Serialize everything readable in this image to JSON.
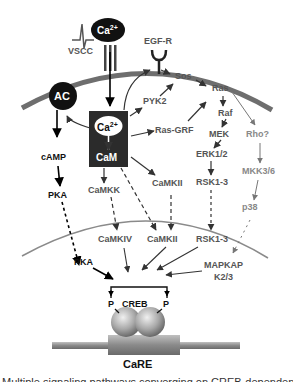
{
  "diagram": {
    "type": "signaling-pathway",
    "membrane_nodes": {
      "vscc": "VSCC",
      "ca_ext": "Ca",
      "ca_ext_sup": "2+",
      "egfr": "EGF-R",
      "ac": "AC"
    },
    "cytoplasm_nodes": {
      "ca_int": "Ca",
      "ca_int_sup": "2+",
      "cam": "CaM",
      "camp": "cAMP",
      "pka_cyto": "PKA",
      "pyk2": "PYK2",
      "sos": "Sos",
      "ras": "Ras",
      "ras_grf": "Ras-GRF",
      "raf": "Raf",
      "mek": "MEK",
      "erk": "ERK1/2",
      "rsk_cyto": "RSK1-3",
      "rho": "Rho?",
      "mkk": "MKK3/6",
      "p38": "p38",
      "camkk": "CaMKK",
      "camkii_cyto": "CaMKII"
    },
    "nuclear_nodes": {
      "pka_nuc": "PKA",
      "camkiv": "CaMKIV",
      "camkii_nuc": "CaMKII",
      "rsk_nuc": "RSK1-3",
      "mapkap_line1": "MAPKAP",
      "mapkap_line2": "K2/3",
      "p_left": "P",
      "creb": "CREB",
      "p_right": "P",
      "care": "CaRE"
    },
    "edges": [
      {
        "from": "Ca2+ (extracellular)",
        "to": "Ca2+/CaM",
        "style": "solid"
      },
      {
        "from": "Ca2+/CaM",
        "to": "AC",
        "style": "solid"
      },
      {
        "from": "AC",
        "to": "cAMP",
        "style": "solid"
      },
      {
        "from": "cAMP",
        "to": "PKA",
        "style": "solid"
      },
      {
        "from": "PKA",
        "to": "PKA (nuclear)",
        "style": "dashed"
      },
      {
        "from": "Ca2+/CaM",
        "to": "EGF-R",
        "style": "solid"
      },
      {
        "from": "Ca2+/CaM",
        "to": "PYK2",
        "style": "solid"
      },
      {
        "from": "PYK2",
        "to": "Sos",
        "style": "solid"
      },
      {
        "from": "EGF-R",
        "to": "Sos",
        "style": "solid"
      },
      {
        "from": "Sos",
        "to": "Ras",
        "style": "solid"
      },
      {
        "from": "Ca2+/CaM",
        "to": "Ras-GRF",
        "style": "solid"
      },
      {
        "from": "Ras-GRF",
        "to": "Ras",
        "style": "solid"
      },
      {
        "from": "Ras",
        "to": "Raf",
        "style": "solid"
      },
      {
        "from": "Raf",
        "to": "MEK",
        "style": "solid"
      },
      {
        "from": "MEK",
        "to": "ERK1/2",
        "style": "solid"
      },
      {
        "from": "ERK1/2",
        "to": "RSK1-3",
        "style": "solid"
      },
      {
        "from": "RSK1-3",
        "to": "RSK1-3 (nuclear)",
        "style": "dashed"
      },
      {
        "from": "Ras",
        "to": "Rho?",
        "style": "solid"
      },
      {
        "from": "Rho?",
        "to": "MKK3/6",
        "style": "solid"
      },
      {
        "from": "MKK3/6",
        "to": "p38",
        "style": "solid"
      },
      {
        "from": "p38",
        "to": "MAPKAP K2/3",
        "style": "dashed"
      },
      {
        "from": "Ca2+/CaM",
        "to": "CaMKK",
        "style": "solid"
      },
      {
        "from": "Ca2+/CaM",
        "to": "CaMKII",
        "style": "solid"
      },
      {
        "from": "Ca2+/CaM",
        "to": "CaMKII (nuclear)",
        "style": "dashed"
      },
      {
        "from": "CaMKK",
        "to": "CaMKIV",
        "style": "dashed"
      },
      {
        "from": "CaMKII",
        "to": "CaMKII (nuclear)",
        "style": "dashed"
      },
      {
        "from": "PKA (nuclear)",
        "to": "CREB",
        "style": "solid"
      },
      {
        "from": "CaMKIV",
        "to": "CREB",
        "style": "solid"
      },
      {
        "from": "CaMKII (nuclear)",
        "to": "CREB",
        "style": "solid"
      },
      {
        "from": "RSK1-3 (nuclear)",
        "to": "CREB",
        "style": "solid"
      },
      {
        "from": "MAPKAP K2/3",
        "to": "CREB",
        "style": "solid"
      }
    ]
  },
  "caption": {
    "text": "Multiple signaling pathways converging on CREB-dependent"
  },
  "colors": {
    "membrane": "#6e6e6e",
    "nucleus": "#8a8a8a",
    "black_node": "#111111",
    "dark_text": "#555555",
    "light_text": "#8a8a8a",
    "camk_box": "#2b2b2b"
  }
}
